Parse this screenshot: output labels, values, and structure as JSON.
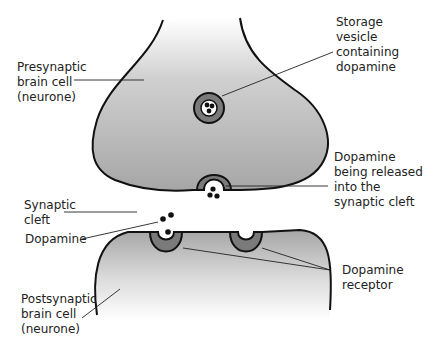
{
  "labels": {
    "presynaptic": "Presynaptic\nbrain cell\n(neurone)",
    "vesicle": "Storage\nvesicle\ncontaining\ndopamine",
    "released": "Dopamine\nbeing released\ninto the\nsynaptic cleft",
    "cleft": "Synaptic\ncleft",
    "dopamine": "Dopamine",
    "receptor": "Dopamine\nreceptor",
    "postsynaptic": "Postsynaptic\nbrain cell\n(neurone)"
  },
  "colors": {
    "cell_fill_dark": "#a9a9a9",
    "cell_fill_light": "#ffffff",
    "vesicle_ring": "#777777",
    "outline": "#111111"
  }
}
